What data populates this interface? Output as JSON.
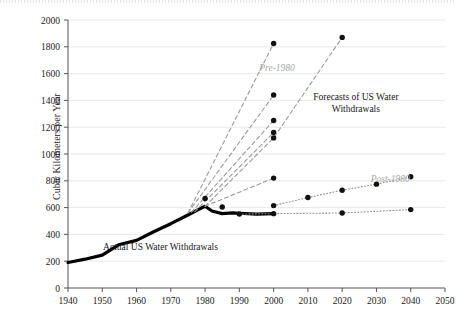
{
  "chart_data": {
    "type": "line",
    "title": "",
    "xlabel": "",
    "ylabel": "Cubic Kilometers per Year",
    "xlim": [
      1940,
      2050
    ],
    "ylim": [
      0,
      2000
    ],
    "xticks": [
      1940,
      1950,
      1960,
      1970,
      1980,
      1990,
      2000,
      2010,
      2020,
      2030,
      2040,
      2050
    ],
    "yticks": [
      0,
      200,
      400,
      600,
      800,
      1000,
      1200,
      1400,
      1600,
      1800,
      2000
    ],
    "grid": true,
    "legend_position": "inline-annotations",
    "annotations": [
      {
        "text": "Actual US Water Withdrawals",
        "x": 1967,
        "y": 285,
        "style": "dark"
      },
      {
        "text": "Pre-1980",
        "x": 2001,
        "y": 1620,
        "style": "grey-italic"
      },
      {
        "text": "Post-1980",
        "x": 2034,
        "y": 790,
        "style": "grey-italic"
      },
      {
        "text": "Forecasts of US Water",
        "x": 2024,
        "y": 1400,
        "style": "dark"
      },
      {
        "text": "Withdrawals",
        "x": 2024,
        "y": 1310,
        "style": "dark"
      }
    ],
    "series": [
      {
        "name": "Actual US Water Withdrawals",
        "style": "solid-thick-black",
        "markers": false,
        "x": [
          1940,
          1945,
          1950,
          1955,
          1960,
          1965,
          1970,
          1975,
          1978,
          1980,
          1982,
          1985,
          1988,
          1990,
          1995,
          2000
        ],
        "values": [
          190,
          215,
          245,
          325,
          355,
          420,
          480,
          545,
          585,
          610,
          575,
          555,
          560,
          558,
          552,
          555
        ]
      },
      {
        "name": "Pre-1980 forecast 1",
        "style": "dashed-grey",
        "markers": true,
        "x": [
          1975,
          2000
        ],
        "values": [
          560,
          1825
        ]
      },
      {
        "name": "Pre-1980 forecast 2",
        "style": "dashed-grey",
        "markers": true,
        "x": [
          1975,
          2000
        ],
        "values": [
          560,
          1440
        ]
      },
      {
        "name": "Pre-1980 forecast 3",
        "style": "dashed-grey",
        "markers": true,
        "x": [
          1976,
          2000
        ],
        "values": [
          565,
          1250
        ]
      },
      {
        "name": "Pre-1980 forecast 4",
        "style": "dashed-grey",
        "markers": true,
        "x": [
          1977,
          2000
        ],
        "values": [
          570,
          1160
        ]
      },
      {
        "name": "Pre-1980 forecast 5",
        "style": "dashed-grey",
        "markers": true,
        "x": [
          1980,
          2000,
          2020
        ],
        "values": [
          610,
          1120,
          1870
        ]
      },
      {
        "name": "Pre-1980 forecast 6",
        "style": "dashed-grey",
        "markers": true,
        "x": [
          1980,
          2000
        ],
        "values": [
          610,
          820
        ]
      },
      {
        "name": "Post-1980 forecast rising",
        "style": "dotted-grey",
        "markers": true,
        "x": [
          2000,
          2010,
          2020,
          2030,
          2040
        ],
        "values": [
          615,
          675,
          730,
          775,
          830
        ]
      },
      {
        "name": "Post-1980 forecast flat",
        "style": "dotted-grey",
        "markers": true,
        "x": [
          1990,
          2000,
          2020,
          2040
        ],
        "values": [
          552,
          555,
          560,
          585
        ]
      }
    ],
    "marker_points": [
      {
        "x": 1980,
        "y": 668
      },
      {
        "x": 1985,
        "y": 605
      }
    ],
    "colors": {
      "actual_line": "#000000",
      "forecast_dashed": "#9a9a9a",
      "forecast_dotted": "#8f8f8f",
      "marker": "#111111",
      "grid": "#e8e8e8",
      "axis": "#555555",
      "label_grey": "#a6a6a6"
    }
  }
}
